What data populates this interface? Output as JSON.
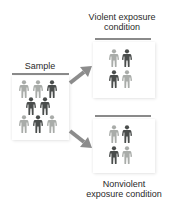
{
  "diagram": {
    "sample": {
      "label": "Sample",
      "figures": [
        {
          "tone": "light"
        },
        {
          "tone": "light"
        },
        {
          "tone": "dark"
        },
        {
          "tone": "dark"
        },
        {
          "tone": "dark"
        },
        {
          "tone": "light"
        },
        {
          "tone": "dark"
        },
        {
          "tone": "light"
        }
      ]
    },
    "conditions": [
      {
        "label": "Violent exposure condition",
        "figures": [
          {
            "tone": "light"
          },
          {
            "tone": "dark"
          },
          {
            "tone": "dark"
          },
          {
            "tone": "light"
          }
        ]
      },
      {
        "label": "Nonviolent exposure condition",
        "figures": [
          {
            "tone": "light"
          },
          {
            "tone": "dark"
          },
          {
            "tone": "dark"
          },
          {
            "tone": "light"
          }
        ]
      }
    ],
    "colors": {
      "figure_light": "#a9aca9",
      "figure_dark": "#4a4d4c",
      "arrow": "#8c8c8c",
      "bar": "#8a8a8a"
    },
    "icons": {
      "person": "person-icon",
      "arrow": "arrow-icon"
    }
  }
}
